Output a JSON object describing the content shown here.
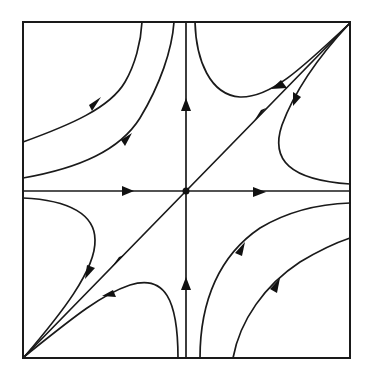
{
  "figure": {
    "type": "phase-portrait",
    "colors": {
      "stroke": "#1a1a1a",
      "background": "#ffffff"
    },
    "frame": {
      "left": 23,
      "top": 22,
      "right": 350,
      "bottom": 358
    },
    "equilibrium": {
      "x": 186,
      "y": 191,
      "kind": "saddle-node-dot"
    },
    "axes": [
      {
        "name": "horizontal-axis",
        "from": [
          23,
          191
        ],
        "to": [
          350,
          191
        ],
        "arrow_direction": "right"
      },
      {
        "name": "vertical-axis",
        "from": [
          186,
          358
        ],
        "to": [
          186,
          22
        ],
        "arrow_direction": "up"
      },
      {
        "name": "diagonal-separatrix",
        "from": [
          350,
          24
        ],
        "to": [
          24,
          357
        ],
        "arrow_direction": "down-left"
      }
    ],
    "trajectories": [
      {
        "region": "upper-left",
        "count": 2,
        "arrow_direction": "up-right"
      },
      {
        "region": "upper-right",
        "count": 2,
        "arrow_direction": "down-left"
      },
      {
        "region": "lower-left",
        "count": 2,
        "arrow_direction": "down-left"
      },
      {
        "region": "lower-right",
        "count": 2,
        "arrow_direction": "up-right"
      }
    ]
  }
}
